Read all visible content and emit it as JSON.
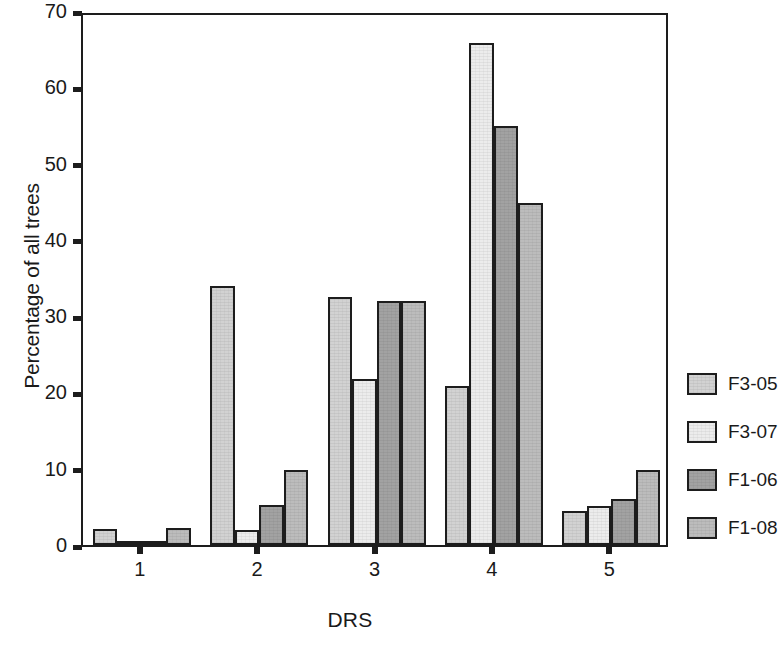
{
  "chart_data": {
    "type": "bar",
    "title": "",
    "subtitle": "",
    "xlabel": "DRS",
    "ylabel": "Percentage of all trees",
    "categories": [
      "1",
      "2",
      "3",
      "4",
      "5"
    ],
    "xtick_labels": [
      "1",
      "2",
      "3",
      "4",
      "5"
    ],
    "ytick_labels": [
      "0",
      "10",
      "20",
      "30",
      "40",
      "50",
      "60",
      "70"
    ],
    "ytick_values": [
      0,
      10,
      20,
      30,
      40,
      50,
      60,
      70
    ],
    "ylim": [
      0,
      70
    ],
    "grid": false,
    "legend_position": "right",
    "series": [
      {
        "name": "F3-05",
        "color": "#d2d2d2",
        "values": [
          2.1,
          34.0,
          32.5,
          20.8,
          4.5
        ]
      },
      {
        "name": "F3-07",
        "color": "#ececec",
        "values": [
          0.3,
          2.0,
          21.7,
          65.8,
          5.1
        ]
      },
      {
        "name": "F1-06",
        "color": "#a2a2a2",
        "values": [
          0.3,
          5.3,
          32.0,
          54.9,
          6.0
        ]
      },
      {
        "name": "F1-08",
        "color": "#bcbcbc",
        "values": [
          2.2,
          9.8,
          32.0,
          44.8,
          9.8
        ]
      }
    ]
  },
  "legend": {
    "items": [
      {
        "label": "F3-05"
      },
      {
        "label": "F3-07"
      },
      {
        "label": "F1-06"
      },
      {
        "label": "F1-08"
      }
    ]
  },
  "axes": {
    "y_title": "Percentage of all trees",
    "x_title": "DRS"
  },
  "style": {
    "axis_color": "#1d1d1d",
    "background": "#ffffff"
  }
}
